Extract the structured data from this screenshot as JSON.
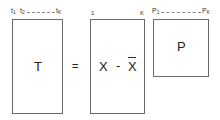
{
  "diagram": {
    "matrix_t": {
      "label": "T",
      "column_labels": {
        "first": "t",
        "first_sub": "1",
        "second": "t",
        "second_sub": "2",
        "last": "t",
        "last_sub": "K"
      }
    },
    "equals": "=",
    "matrix_x": {
      "label_left": "X",
      "operator": "-",
      "label_right": "X",
      "label_right_decoration": "overbar (mean)",
      "column_labels": {
        "first": "1",
        "last": "K"
      }
    },
    "matrix_p": {
      "label": "P",
      "column_labels": {
        "first": "P",
        "first_sub": "1",
        "last": "P",
        "last_sub": "K"
      }
    }
  }
}
